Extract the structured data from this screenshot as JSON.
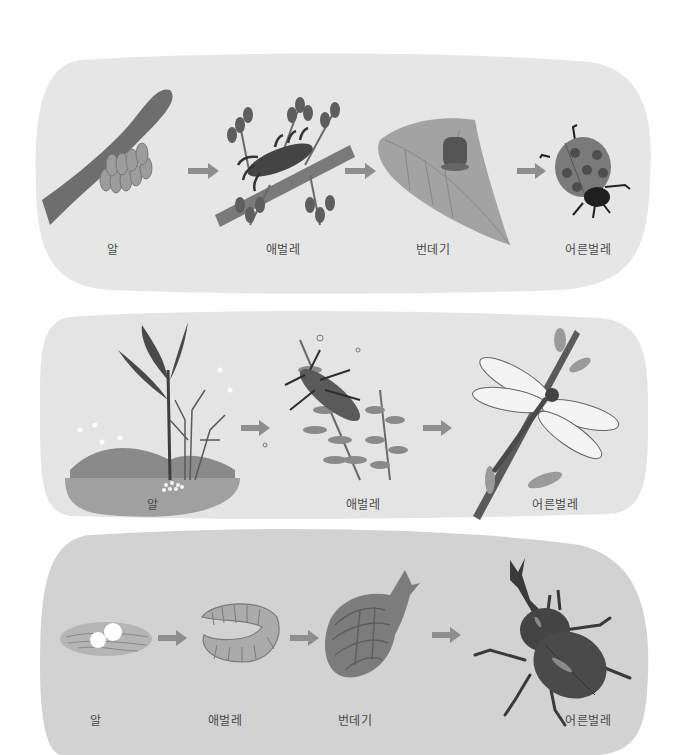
{
  "colors": {
    "panel1_bg": "#e6e6e6",
    "panel2_bg": "#e4e4e4",
    "panel3_bg": "#d2d2d2",
    "arrow": "#8e8e8e",
    "label_text": "#4a4a4a",
    "dark": "#3a3a3a",
    "mid": "#707070",
    "light": "#9a9a9a"
  },
  "panels": [
    {
      "name": "ladybug-life-cycle",
      "stages": [
        {
          "label": "알",
          "depicts": "eggs cluster on branch"
        },
        {
          "label": "애벌레",
          "depicts": "larva on twig with leaves"
        },
        {
          "label": "번데기",
          "depicts": "pupa on leaf"
        },
        {
          "label": "어른벌레",
          "depicts": "adult ladybug"
        }
      ]
    },
    {
      "name": "dragonfly-life-cycle",
      "stages": [
        {
          "label": "알",
          "depicts": "eggs in pond soil with plants"
        },
        {
          "label": "애벌레",
          "depicts": "nymph among water plants"
        },
        {
          "label": "어른벌레",
          "depicts": "adult dragonfly on stem"
        }
      ]
    },
    {
      "name": "rhinoceros-beetle-life-cycle",
      "stages": [
        {
          "label": "알",
          "depicts": "two eggs in soil"
        },
        {
          "label": "애벌레",
          "depicts": "curled grub larva"
        },
        {
          "label": "번데기",
          "depicts": "pupa"
        },
        {
          "label": "어른벌레",
          "depicts": "adult rhinoceros beetle"
        }
      ]
    }
  ]
}
